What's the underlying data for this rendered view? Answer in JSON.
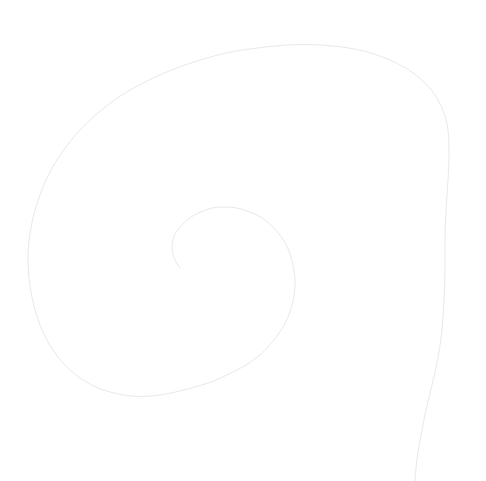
{
  "canvas": {
    "width": 486,
    "height": 481,
    "background_color": "#ffffff",
    "title": "Spiral line drawing"
  },
  "figure": {
    "name": "spiral",
    "type": "logarithmic-spiral",
    "direction": "clockwise-outward",
    "stroke_color": "#e9e9ec",
    "stroke_width": 1,
    "fill": "none",
    "center_x": 205,
    "center_y": 260,
    "turns": 1.85,
    "growth_factor": 2.2,
    "inner_radius": 28,
    "outer_radius": 250,
    "start_angle_deg": 205,
    "inner_terminus": {
      "x": 180,
      "y": 268
    },
    "outer_terminus": {
      "x": 415,
      "y": 481
    },
    "extremes": {
      "topmost": {
        "x": 235,
        "y": 45
      },
      "leftmost": {
        "x": 28,
        "y": 225
      },
      "bottommost_visible": {
        "x": 160,
        "y": 400
      },
      "rightmost": {
        "x": 448,
        "y": 230
      }
    },
    "inner_loop": {
      "top": {
        "x": 215,
        "y": 207
      },
      "right": {
        "x": 295,
        "y": 280
      },
      "bottom": {
        "x": 230,
        "y": 345
      }
    }
  },
  "chart_data": {
    "type": "line",
    "xlabel": "",
    "ylabel": "",
    "xlim": [
      0,
      486
    ],
    "ylim": [
      481,
      0
    ],
    "grid": false,
    "legend": false,
    "series": [
      {
        "name": "spiral",
        "color": "#e9e9ec",
        "points": [
          [
            180,
            268
          ],
          [
            176,
            262
          ],
          [
            173,
            255
          ],
          [
            172,
            247
          ],
          [
            173,
            239
          ],
          [
            177,
            231
          ],
          [
            183,
            224
          ],
          [
            191,
            217
          ],
          [
            201,
            212
          ],
          [
            212,
            208
          ],
          [
            224,
            207
          ],
          [
            237,
            208
          ],
          [
            250,
            212
          ],
          [
            262,
            218
          ],
          [
            273,
            227
          ],
          [
            282,
            238
          ],
          [
            289,
            251
          ],
          [
            293,
            265
          ],
          [
            295,
            280
          ],
          [
            294,
            296
          ],
          [
            290,
            312
          ],
          [
            283,
            327
          ],
          [
            273,
            341
          ],
          [
            261,
            354
          ],
          [
            246,
            365
          ],
          [
            229,
            374
          ],
          [
            211,
            382
          ],
          [
            191,
            388
          ],
          [
            171,
            393
          ],
          [
            151,
            396
          ],
          [
            132,
            396
          ],
          [
            114,
            393
          ],
          [
            98,
            388
          ],
          [
            83,
            380
          ],
          [
            70,
            370
          ],
          [
            58,
            357
          ],
          [
            48,
            342
          ],
          [
            40,
            325
          ],
          [
            34,
            306
          ],
          [
            30,
            286
          ],
          [
            28,
            264
          ],
          [
            29,
            241
          ],
          [
            33,
            218
          ],
          [
            40,
            195
          ],
          [
            50,
            172
          ],
          [
            63,
            151
          ],
          [
            79,
            131
          ],
          [
            98,
            113
          ],
          [
            119,
            97
          ],
          [
            143,
            83
          ],
          [
            169,
            71
          ],
          [
            197,
            61
          ],
          [
            226,
            53
          ],
          [
            257,
            48
          ],
          [
            288,
            45
          ],
          [
            319,
            45
          ],
          [
            349,
            48
          ],
          [
            377,
            55
          ],
          [
            402,
            66
          ],
          [
            423,
            81
          ],
          [
            438,
            100
          ],
          [
            447,
            124
          ],
          [
            449,
            151
          ],
          [
            448,
            180
          ],
          [
            446,
            210
          ],
          [
            445,
            240
          ],
          [
            445,
            270
          ],
          [
            444,
            300
          ],
          [
            442,
            330
          ],
          [
            438,
            358
          ],
          [
            432,
            385
          ],
          [
            426,
            410
          ],
          [
            421,
            435
          ],
          [
            417,
            459
          ],
          [
            415,
            481
          ]
        ]
      }
    ]
  }
}
